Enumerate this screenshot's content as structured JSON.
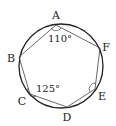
{
  "diagram": {
    "type": "cyclic-hexagon",
    "circle": {
      "cx": 61,
      "cy": 66,
      "r": 42
    },
    "vertices": [
      {
        "name": "A",
        "x": 56,
        "y": 25,
        "lx": 56,
        "ly": 19
      },
      {
        "name": "F",
        "x": 100,
        "y": 48,
        "lx": 106,
        "ly": 48
      },
      {
        "name": "E",
        "x": 95,
        "y": 89,
        "lx": 102,
        "ly": 98
      },
      {
        "name": "D",
        "x": 67,
        "y": 107,
        "lx": 67,
        "ly": 121
      },
      {
        "name": "C",
        "x": 30,
        "y": 94,
        "lx": 22,
        "ly": 104
      },
      {
        "name": "B",
        "x": 19,
        "y": 57,
        "lx": 11,
        "ly": 61
      }
    ],
    "angle_labels": [
      {
        "vertex": "A",
        "text": "110°",
        "x": 48,
        "y": 41
      },
      {
        "vertex": "C",
        "text": "125°",
        "x": 36,
        "y": 91
      }
    ],
    "angle_marks": [
      "A",
      "C",
      "E"
    ],
    "stroke_color": "#333333"
  }
}
